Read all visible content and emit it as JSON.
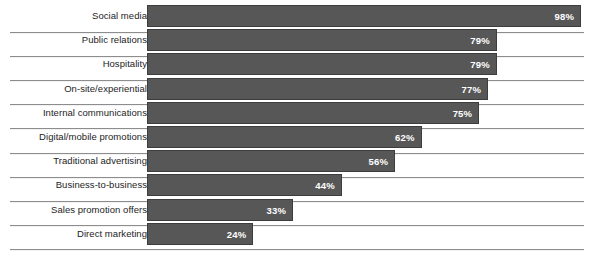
{
  "chart_data": {
    "type": "bar",
    "orientation": "horizontal",
    "title": "",
    "subtitle": "",
    "xlabel": "",
    "ylabel": "",
    "xlim": [
      0,
      100
    ],
    "grid": false,
    "legend": null,
    "value_suffix": "%",
    "categories": [
      "Social media",
      "Public relations",
      "Hospitality",
      "On-site/experiential",
      "Internal communications",
      "Digital/mobile promotions",
      "Traditional advertising",
      "Business-to-business",
      "Sales promotion offers",
      "Direct marketing"
    ],
    "values": [
      98,
      79,
      79,
      77,
      75,
      62,
      56,
      44,
      33,
      24
    ],
    "data_labels": [
      "98%",
      "79%",
      "79%",
      "77%",
      "75%",
      "62%",
      "56%",
      "44%",
      "33%",
      "24%"
    ],
    "colors": {
      "bar_fill": "#575757",
      "bar_border": "#3d3d3d",
      "value_text": "#ffffff",
      "label_text": "#1d1d1d",
      "divider": "#8d8d8d",
      "background": "#ffffff"
    }
  }
}
